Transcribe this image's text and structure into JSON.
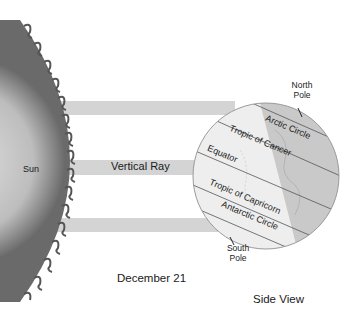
{
  "diagram": {
    "title": "December 21",
    "view_label": "Side View",
    "sun_label": "Sun",
    "ray_label": "Vertical Ray",
    "north_pole": [
      "North",
      "Pole"
    ],
    "south_pole": [
      "South",
      "Pole"
    ],
    "latitude_lines": [
      {
        "name": "Arctic Circle"
      },
      {
        "name": "Tropic of Cancer"
      },
      {
        "name": "Equator"
      },
      {
        "name": "Tropic of Capricorn"
      },
      {
        "name": "Antarctic Circle"
      }
    ],
    "colors": {
      "beam": "#d4d4d4",
      "globe_lit": "#eeeeee",
      "globe_dark": "#c9c9c9",
      "sun_edge": "#6e6e6e",
      "sun_center": "#d8d8d8"
    }
  }
}
